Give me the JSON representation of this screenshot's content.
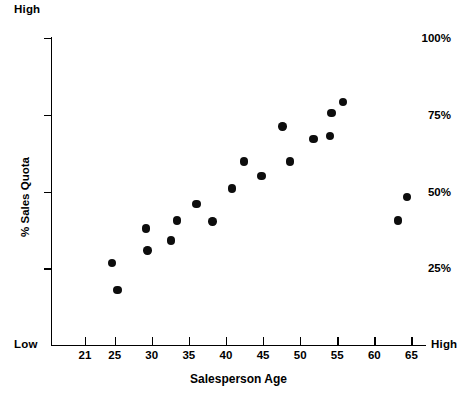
{
  "chart_data": {
    "type": "scatter",
    "title": "",
    "xlabel": "Salesperson Age",
    "ylabel": "% Sales Quota",
    "xlim": [
      19.8,
      66.5
    ],
    "ylim": [
      0,
      107
    ],
    "grid": false,
    "legend": null,
    "xticks": [
      21,
      25,
      30,
      35,
      40,
      45,
      50,
      55,
      60,
      65
    ],
    "xtick_labels": [
      "21",
      "25",
      "30",
      "35",
      "40",
      "45",
      "50",
      "55",
      "60",
      "65"
    ],
    "yticks": [
      25,
      50,
      75,
      100
    ],
    "ytick_labels": [
      "25%",
      "50%",
      "75%",
      "100%"
    ],
    "axis_end_labels": {
      "y_top": "High",
      "y_bottom": "Low",
      "x_right": "High"
    },
    "marker": {
      "shape": "circle",
      "color": "#0d0d0d",
      "size_px": 8.4
    },
    "points": [
      {
        "x": 24.6,
        "y": 26.8
      },
      {
        "x": 25.4,
        "y": 18.0
      },
      {
        "x": 29.2,
        "y": 38.0
      },
      {
        "x": 29.4,
        "y": 30.8
      },
      {
        "x": 32.6,
        "y": 34.0
      },
      {
        "x": 33.4,
        "y": 40.6
      },
      {
        "x": 36.0,
        "y": 46.0
      },
      {
        "x": 38.2,
        "y": 40.2
      },
      {
        "x": 40.8,
        "y": 51.0
      },
      {
        "x": 42.4,
        "y": 59.8
      },
      {
        "x": 44.8,
        "y": 55.0
      },
      {
        "x": 47.6,
        "y": 71.2
      },
      {
        "x": 48.6,
        "y": 59.8
      },
      {
        "x": 51.8,
        "y": 67.2
      },
      {
        "x": 54.2,
        "y": 75.6
      },
      {
        "x": 54.0,
        "y": 68.0
      },
      {
        "x": 55.8,
        "y": 79.2
      },
      {
        "x": 63.2,
        "y": 40.6
      },
      {
        "x": 64.4,
        "y": 48.2
      }
    ]
  },
  "labels": {
    "high_top": "High",
    "low_left": "Low",
    "high_right": "High",
    "x_title": "Salesperson Age",
    "y_title": "% Sales Quota"
  }
}
